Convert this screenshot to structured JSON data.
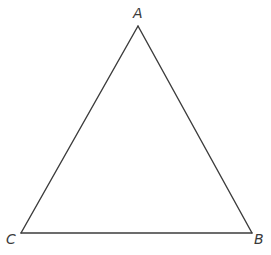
{
  "diagram": {
    "type": "triangle",
    "stroke_color": "#3c3c3c",
    "label_color": "#3a3a3a",
    "vertices": {
      "A": {
        "label": "A",
        "x": 138,
        "y": 26
      },
      "B": {
        "label": "B",
        "x": 252,
        "y": 233
      },
      "C": {
        "label": "C",
        "x": 21,
        "y": 233
      }
    },
    "sides": [
      "AB",
      "BC",
      "CA"
    ]
  }
}
